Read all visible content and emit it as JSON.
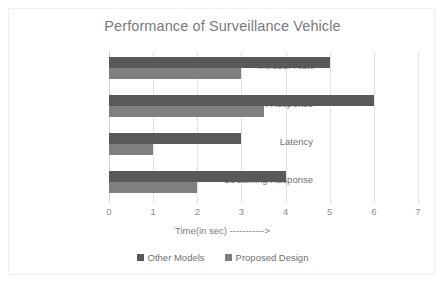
{
  "chart_data": {
    "type": "bar",
    "orientation": "horizontal",
    "title": "Performance of Surveillance Vehicle",
    "xlabel": "Time(in sec) ----------->",
    "ylabel": "",
    "xlim": [
      0,
      7
    ],
    "xticks": [
      "0",
      "1",
      "2",
      "3",
      "4",
      "5",
      "6",
      "7"
    ],
    "grid": true,
    "legend_position": "bottom",
    "categories": [
      "Intruder Alert",
      "Detection Response",
      "Latency",
      "Streaming Response"
    ],
    "series": [
      {
        "name": "Other Models",
        "color": "#595959",
        "values": [
          5,
          6,
          3,
          4
        ]
      },
      {
        "name": "Proposed Design",
        "color": "#7f7f7f",
        "values": [
          3,
          3.5,
          1,
          2
        ]
      }
    ]
  },
  "colors": {
    "title_text": "#7a7a7a",
    "label_text": "#6f6f6f",
    "gridline": "#e4e4e4",
    "frame_border": "#eceff1",
    "plot_background": "#ffffff"
  }
}
